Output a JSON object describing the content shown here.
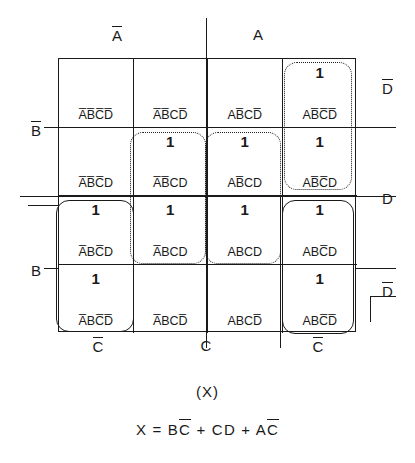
{
  "axis": {
    "top": [
      {
        "name": "A-not",
        "text": "A",
        "bar": true
      },
      {
        "name": "A",
        "text": "A",
        "bar": false
      }
    ],
    "left": [
      {
        "name": "B-not",
        "text": "B",
        "bar": true
      },
      {
        "name": "B",
        "text": "B",
        "bar": false
      }
    ],
    "right": [
      {
        "name": "D-not-top",
        "text": "D",
        "bar": true
      },
      {
        "name": "D",
        "text": "D",
        "bar": false
      },
      {
        "name": "D-not-bottom",
        "text": "D",
        "bar": true
      }
    ],
    "bottom": [
      {
        "name": "C-not-left",
        "text": "C",
        "bar": true
      },
      {
        "name": "C",
        "text": "C",
        "bar": false
      },
      {
        "name": "C-not-right",
        "text": "C",
        "bar": true
      }
    ]
  },
  "grid": {
    "rows": 4,
    "cols": 4,
    "cells": [
      {
        "term": "A̅B̅C̅D̅",
        "value": "",
        "row": 0,
        "col": 0
      },
      {
        "term": "A̅B̅CD̅",
        "value": "",
        "row": 0,
        "col": 1
      },
      {
        "term": "AB̅CD̅",
        "value": "",
        "row": 0,
        "col": 2
      },
      {
        "term": "AB̅C̅D̅",
        "value": "1",
        "row": 0,
        "col": 3
      },
      {
        "term": "A̅B̅C̅D",
        "value": "",
        "row": 1,
        "col": 0
      },
      {
        "term": "A̅B̅CD",
        "value": "1",
        "row": 1,
        "col": 1
      },
      {
        "term": "AB̅CD",
        "value": "1",
        "row": 1,
        "col": 2
      },
      {
        "term": "AB̅C̅D",
        "value": "1",
        "row": 1,
        "col": 3
      },
      {
        "term": "A̅BC̅D",
        "value": "1",
        "row": 2,
        "col": 0
      },
      {
        "term": "A̅BCD",
        "value": "1",
        "row": 2,
        "col": 1
      },
      {
        "term": "ABCD",
        "value": "1",
        "row": 2,
        "col": 2
      },
      {
        "term": "ABC̅D",
        "value": "1",
        "row": 2,
        "col": 3
      },
      {
        "term": "A̅BC̅D̅",
        "value": "1",
        "row": 3,
        "col": 0
      },
      {
        "term": "A̅BCD̅",
        "value": "",
        "row": 3,
        "col": 1
      },
      {
        "term": "ABCD̅",
        "value": "",
        "row": 3,
        "col": 2
      },
      {
        "term": "ABC̅D̅",
        "value": "1",
        "row": 3,
        "col": 3
      }
    ]
  },
  "groups": [
    {
      "name": "group-bc-not-left",
      "style": "solid",
      "term": "BC̅"
    },
    {
      "name": "group-cd-col2",
      "style": "dotted",
      "term": "CD"
    },
    {
      "name": "group-cd-col3",
      "style": "dotted",
      "term": "CD"
    },
    {
      "name": "group-ac-not-upper",
      "style": "dotted",
      "term": "AC̅"
    },
    {
      "name": "group-ac-not-lower",
      "style": "solid",
      "term": "AC̅"
    }
  ],
  "caption": "(X)",
  "equation": {
    "lhs": "X",
    "eq": "=",
    "terms": [
      {
        "text": "BC",
        "bar_tail": "C"
      },
      {
        "text": "CD",
        "bar_tail": ""
      },
      {
        "text": "AC",
        "bar_tail": "C"
      }
    ],
    "plain": "X = BC̅ + CD + AC̅"
  }
}
